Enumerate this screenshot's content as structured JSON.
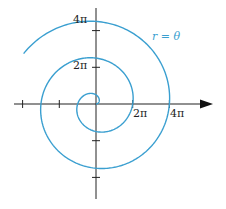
{
  "figure": {
    "type": "polar-curve",
    "equation_label": "r = θ",
    "curve_color": "#3a9fd0",
    "axis_color": "#222222",
    "x_axis_labels": [
      "2π",
      "4π"
    ],
    "y_axis_labels": [
      "2π",
      "4π"
    ],
    "origin_px": [
      96,
      104
    ],
    "scale_px_per_2pi": 36.7,
    "theta_range": [
      0,
      15.1
    ]
  }
}
